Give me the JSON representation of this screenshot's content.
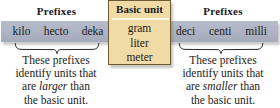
{
  "colors": {
    "bar_gray": "#adb3c4",
    "basic_unit_fill": "#f0dba6",
    "basic_unit_border": "#6e5a33",
    "text": "#1c1c20",
    "rule_light": "#fdf6e4",
    "page_background": "#ffffff"
  },
  "left_section": {
    "heading": "Prefixes",
    "prefixes": [
      "kilo",
      "hecto",
      "deka"
    ],
    "caption_lines": [
      "These prefixes",
      "identify units that",
      "are larger than",
      "the basic unit."
    ],
    "caption_emphasis": "larger",
    "caption_line3_before": "are ",
    "caption_line3_after": " than"
  },
  "basic_unit": {
    "title": "Basic unit",
    "units": [
      "gram",
      "liter",
      "meter"
    ]
  },
  "right_section": {
    "heading": "Prefixes",
    "prefixes": [
      "deci",
      "centi",
      "milli"
    ],
    "caption_lines": [
      "These prefixes",
      "identify units that",
      "are smaller than",
      "the basic unit."
    ],
    "caption_emphasis": "smaller",
    "caption_line3_before": "are ",
    "caption_line3_after": " than"
  }
}
